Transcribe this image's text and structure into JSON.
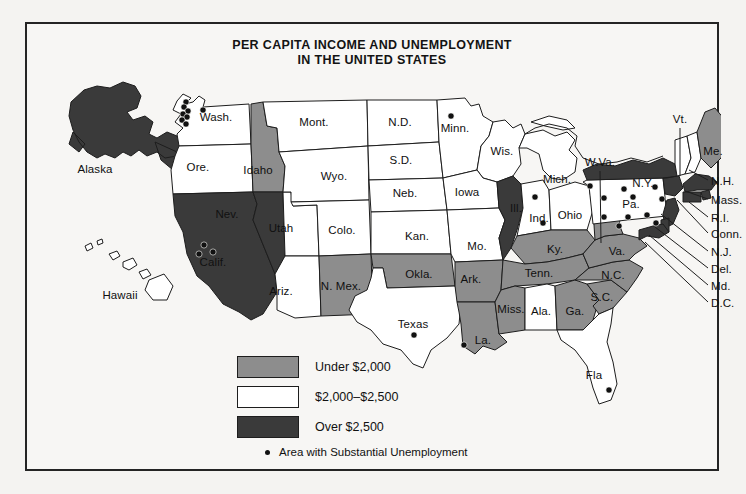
{
  "title": {
    "line1": "PER CAPITA INCOME AND UNEMPLOYMENT",
    "line2": "IN THE UNITED STATES"
  },
  "legend": {
    "items": [
      {
        "label": "Under $2,000",
        "swatch": "#8d8d8d",
        "class": "under"
      },
      {
        "label": "$2,000–$2,500",
        "swatch": "#ffffff",
        "class": "mid"
      },
      {
        "label": "Over $2,500",
        "swatch": "#3a3a3a",
        "class": "over"
      }
    ],
    "note": "Area with Substantial Unemployment",
    "note_marker": "dot"
  },
  "colors": {
    "under_2000": "#8d8d8d",
    "between": "#ffffff",
    "over_2500": "#3a3a3a",
    "outline": "#1d1d1d",
    "paper": "#f7f6f4",
    "dot": "#111111"
  },
  "map": {
    "insets": [
      {
        "name": "Alaska",
        "label": "Alaska",
        "x": 68,
        "y": 145,
        "fill": "over_2500"
      },
      {
        "name": "Hawaii",
        "label": "Hawaii",
        "x": 93,
        "y": 271,
        "fill": "between"
      }
    ],
    "state_labels": [
      {
        "code": "WA",
        "label": "Wash.",
        "x": 189,
        "y": 93,
        "fill": "between"
      },
      {
        "code": "OR",
        "label": "Ore.",
        "x": 171,
        "y": 143,
        "fill": "between"
      },
      {
        "code": "ID",
        "label": "Idaho",
        "x": 231,
        "y": 146,
        "fill": "under_2000"
      },
      {
        "code": "MT",
        "label": "Mont.",
        "x": 287,
        "y": 98,
        "fill": "between"
      },
      {
        "code": "ND",
        "label": "N.D.",
        "x": 373,
        "y": 98,
        "fill": "between"
      },
      {
        "code": "SD",
        "label": "S.D.",
        "x": 374,
        "y": 136,
        "fill": "between"
      },
      {
        "code": "MN",
        "label": "Minn.",
        "x": 428,
        "y": 104,
        "fill": "between"
      },
      {
        "code": "WI",
        "label": "Wis.",
        "x": 475,
        "y": 127,
        "fill": "between"
      },
      {
        "code": "WY",
        "label": "Wyo.",
        "x": 307,
        "y": 152,
        "fill": "between"
      },
      {
        "code": "NE",
        "label": "Neb.",
        "x": 378,
        "y": 169,
        "fill": "between"
      },
      {
        "code": "IA",
        "label": "Iowa",
        "x": 440,
        "y": 168,
        "fill": "between"
      },
      {
        "code": "MI",
        "label": "Mich.",
        "x": 530,
        "y": 155,
        "fill": "between"
      },
      {
        "code": "IL",
        "label": "Ill.",
        "x": 489,
        "y": 184,
        "fill": "over_2500"
      },
      {
        "code": "IN",
        "label": "Ind.",
        "x": 512,
        "y": 194,
        "fill": "between"
      },
      {
        "code": "OH",
        "label": "Ohio",
        "x": 543,
        "y": 191,
        "fill": "between"
      },
      {
        "code": "NV",
        "label": "Nev.",
        "x": 200,
        "y": 190,
        "fill": "over_2500"
      },
      {
        "code": "UT",
        "label": "Utah",
        "x": 254,
        "y": 204,
        "fill": "between"
      },
      {
        "code": "CO",
        "label": "Colo.",
        "x": 315,
        "y": 206,
        "fill": "between"
      },
      {
        "code": "KS",
        "label": "Kan.",
        "x": 390,
        "y": 212,
        "fill": "between"
      },
      {
        "code": "MO",
        "label": "Mo.",
        "x": 450,
        "y": 222,
        "fill": "between"
      },
      {
        "code": "CA",
        "label": "Calif.",
        "x": 186,
        "y": 238,
        "fill": "over_2500"
      },
      {
        "code": "AZ",
        "label": "Ariz.",
        "x": 254,
        "y": 267,
        "fill": "between"
      },
      {
        "code": "NM",
        "label": "N. Mex.",
        "x": 314,
        "y": 262,
        "fill": "under_2000"
      },
      {
        "code": "OK",
        "label": "Okla.",
        "x": 392,
        "y": 250,
        "fill": "under_2000"
      },
      {
        "code": "AR",
        "label": "Ark.",
        "x": 444,
        "y": 255,
        "fill": "under_2000"
      },
      {
        "code": "TX",
        "label": "Texas",
        "x": 386,
        "y": 300,
        "fill": "between"
      },
      {
        "code": "LA",
        "label": "La.",
        "x": 456,
        "y": 316,
        "fill": "under_2000"
      },
      {
        "code": "MS",
        "label": "Miss.",
        "x": 484,
        "y": 285,
        "fill": "under_2000"
      },
      {
        "code": "AL",
        "label": "Ala.",
        "x": 514,
        "y": 287,
        "fill": "between"
      },
      {
        "code": "GA",
        "label": "Ga.",
        "x": 548,
        "y": 287,
        "fill": "under_2000"
      },
      {
        "code": "TN",
        "label": "Tenn.",
        "x": 512,
        "y": 249,
        "fill": "under_2000"
      },
      {
        "code": "KY",
        "label": "Ky.",
        "x": 528,
        "y": 225,
        "fill": "under_2000"
      },
      {
        "code": "SC",
        "label": "S.C.",
        "x": 575,
        "y": 273,
        "fill": "under_2000"
      },
      {
        "code": "NC",
        "label": "N.C.",
        "x": 586,
        "y": 251,
        "fill": "under_2000"
      },
      {
        "code": "VA",
        "label": "Va.",
        "x": 590,
        "y": 227,
        "fill": "under_2000"
      },
      {
        "code": "FL",
        "label": "Fla",
        "x": 567,
        "y": 351,
        "fill": "between"
      },
      {
        "code": "PA",
        "label": "Pa.",
        "x": 604,
        "y": 180,
        "fill": "between"
      },
      {
        "code": "NY",
        "label": "N.Y.",
        "x": 616,
        "y": 159,
        "fill": "over_2500"
      },
      {
        "code": "ME",
        "label": "Me.",
        "x": 686,
        "y": 127,
        "fill": "under_2000"
      }
    ],
    "leader_labels": [
      {
        "code": "VT",
        "label": "Vt.",
        "x": 653,
        "y": 95,
        "anchor": "center",
        "line": [
          [
            653,
            104
          ],
          [
            653,
            152
          ]
        ]
      },
      {
        "code": "WV",
        "label": "W.Va.",
        "x": 573,
        "y": 138,
        "anchor": "center",
        "line": [
          [
            573,
            147
          ],
          [
            574,
            219
          ]
        ]
      },
      {
        "code": "NH",
        "label": "N.H.",
        "x": 684,
        "y": 157,
        "anchor": "left",
        "line": [
          [
            681,
            156
          ],
          [
            662,
            146
          ]
        ]
      },
      {
        "code": "MA",
        "label": "Mass.",
        "x": 684,
        "y": 176,
        "anchor": "left",
        "line": [
          [
            681,
            175
          ],
          [
            658,
            167
          ]
        ]
      },
      {
        "code": "RI",
        "label": "R.I.",
        "x": 684,
        "y": 194,
        "anchor": "left",
        "line": [
          [
            681,
            193
          ],
          [
            662,
            178
          ]
        ]
      },
      {
        "code": "CT",
        "label": "Conn.",
        "x": 684,
        "y": 210,
        "anchor": "left",
        "line": [
          [
            681,
            209
          ],
          [
            650,
            176
          ]
        ]
      },
      {
        "code": "NJ",
        "label": "N.J.",
        "x": 684,
        "y": 228,
        "anchor": "left",
        "line": [
          [
            681,
            227
          ],
          [
            634,
            190
          ]
        ]
      },
      {
        "code": "DE",
        "label": "Del.",
        "x": 684,
        "y": 245,
        "anchor": "left",
        "line": [
          [
            681,
            244
          ],
          [
            628,
            203
          ]
        ]
      },
      {
        "code": "MD",
        "label": "Md.",
        "x": 684,
        "y": 262,
        "anchor": "left",
        "line": [
          [
            681,
            261
          ],
          [
            622,
            211
          ]
        ]
      },
      {
        "code": "DC",
        "label": "D.C.",
        "x": 684,
        "y": 279,
        "anchor": "left",
        "line": [
          [
            681,
            278
          ],
          [
            618,
            218
          ]
        ]
      }
    ],
    "unemployment_dots": [
      {
        "x": 176,
        "y": 86
      },
      {
        "x": 159,
        "y": 78
      },
      {
        "x": 157,
        "y": 83
      },
      {
        "x": 161,
        "y": 87
      },
      {
        "x": 156,
        "y": 90
      },
      {
        "x": 160,
        "y": 93
      },
      {
        "x": 155,
        "y": 96
      },
      {
        "x": 159,
        "y": 100
      },
      {
        "x": 177,
        "y": 221
      },
      {
        "x": 172,
        "y": 230
      },
      {
        "x": 186,
        "y": 228
      },
      {
        "x": 424,
        "y": 92
      },
      {
        "x": 508,
        "y": 173
      },
      {
        "x": 516,
        "y": 199
      },
      {
        "x": 563,
        "y": 162
      },
      {
        "x": 597,
        "y": 165
      },
      {
        "x": 628,
        "y": 163
      },
      {
        "x": 577,
        "y": 174
      },
      {
        "x": 606,
        "y": 173
      },
      {
        "x": 635,
        "y": 175
      },
      {
        "x": 577,
        "y": 193
      },
      {
        "x": 601,
        "y": 193
      },
      {
        "x": 620,
        "y": 191
      },
      {
        "x": 592,
        "y": 202
      },
      {
        "x": 629,
        "y": 199
      },
      {
        "x": 437,
        "y": 321
      },
      {
        "x": 387,
        "y": 311
      },
      {
        "x": 582,
        "y": 366
      }
    ]
  },
  "bleed_text": [
    {
      "text": "the one of the",
      "x": 330,
      "y": 318
    },
    {
      "text": "of the sidelines",
      "x": 120,
      "y": 340
    },
    {
      "text": "that it",
      "x": 380,
      "y": 344
    },
    {
      "text": "to so many",
      "x": 470,
      "y": 352
    },
    {
      "text": "of the",
      "x": 300,
      "y": 170
    },
    {
      "text": "the",
      "x": 72,
      "y": 230
    },
    {
      "text": "and",
      "x": 640,
      "y": 36
    }
  ]
}
